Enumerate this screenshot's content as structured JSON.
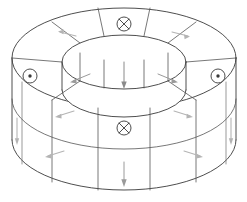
{
  "figure": {
    "shape_type": "torus",
    "projection": "isometric-perspective",
    "background_color": "#ffffff",
    "outline_color": "#3a3a3a",
    "segment_line_color": "#555555",
    "arrow_color": "#b4b4b4",
    "segment_count": 8
  },
  "geometry": {
    "outer_ellipse_top": {
      "cx": 124,
      "cy": 58,
      "rx": 112,
      "ry": 50
    },
    "outer_ellipse_bottom": {
      "cx": 124,
      "cy": 140,
      "rx": 112,
      "ry": 50
    },
    "inner_ellipse_top": {
      "cx": 124,
      "cy": 62,
      "rx": 62,
      "ry": 27
    },
    "inner_ellipse_bottom": {
      "cx": 124,
      "cy": 90,
      "rx": 62,
      "ry": 27
    },
    "wall_height_px": 82
  },
  "symbols": [
    {
      "id": "top-cross",
      "glyph": "circle-cross",
      "meaning": "current into the page",
      "position": {
        "x": 124,
        "y": 24
      },
      "radius": 7
    },
    {
      "id": "left-dot",
      "glyph": "circle-dot",
      "meaning": "current out of the page",
      "position": {
        "x": 30,
        "y": 76
      },
      "radius": 7
    },
    {
      "id": "right-dot",
      "glyph": "circle-dot",
      "meaning": "current out of the page",
      "position": {
        "x": 218,
        "y": 76
      },
      "radius": 7
    },
    {
      "id": "bottom-cross",
      "glyph": "circle-cross",
      "meaning": "current into the page",
      "position": {
        "x": 124,
        "y": 128
      },
      "radius": 7
    }
  ],
  "arrows": {
    "top_surface": [
      {
        "id": "top-left-arrow",
        "from": {
          "x": 75,
          "y": 35
        },
        "to": {
          "x": 58,
          "y": 31
        },
        "direction": "left"
      },
      {
        "id": "top-right-arrow",
        "from": {
          "x": 172,
          "y": 32
        },
        "to": {
          "x": 190,
          "y": 36
        },
        "direction": "right"
      }
    ],
    "inner_wall": [
      {
        "id": "inner-left-arrow",
        "from": {
          "x": 88,
          "y": 76
        },
        "to": {
          "x": 70,
          "y": 83
        },
        "direction": "down-left"
      },
      {
        "id": "inner-center-arrow",
        "from": {
          "x": 124,
          "y": 62
        },
        "to": {
          "x": 124,
          "y": 88
        },
        "direction": "down"
      },
      {
        "id": "inner-right-arrow",
        "from": {
          "x": 160,
          "y": 76
        },
        "to": {
          "x": 178,
          "y": 83
        },
        "direction": "down-right"
      }
    ],
    "outer_wall": [
      {
        "id": "outer-left-upper-arrow",
        "from": {
          "x": 72,
          "y": 112
        },
        "to": {
          "x": 55,
          "y": 117
        },
        "direction": "left"
      },
      {
        "id": "outer-left-lower-arrow",
        "from": {
          "x": 62,
          "y": 152
        },
        "to": {
          "x": 45,
          "y": 157
        },
        "direction": "left"
      },
      {
        "id": "outer-center-arrow",
        "from": {
          "x": 124,
          "y": 162
        },
        "to": {
          "x": 124,
          "y": 186
        },
        "direction": "down"
      },
      {
        "id": "outer-right-upper-arrow",
        "from": {
          "x": 176,
          "y": 112
        },
        "to": {
          "x": 193,
          "y": 117
        },
        "direction": "right"
      },
      {
        "id": "outer-right-lower-arrow",
        "from": {
          "x": 186,
          "y": 152
        },
        "to": {
          "x": 203,
          "y": 157
        },
        "direction": "right"
      }
    ],
    "side_edges": [
      {
        "id": "far-left-edge-arrow",
        "from": {
          "x": 16,
          "y": 120
        },
        "to": {
          "x": 16,
          "y": 145
        },
        "direction": "down"
      },
      {
        "id": "far-right-edge-arrow",
        "from": {
          "x": 231,
          "y": 120
        },
        "to": {
          "x": 231,
          "y": 145
        },
        "direction": "down"
      }
    ]
  }
}
